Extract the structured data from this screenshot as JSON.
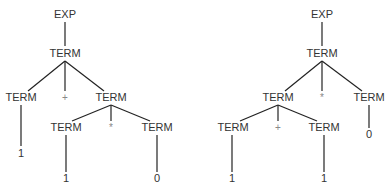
{
  "diagram": {
    "type": "parse-tree-comparison",
    "trees": [
      {
        "id": "left",
        "nodes": [
          {
            "label": "EXP",
            "x": 65,
            "y": 18
          },
          {
            "label": "TERM",
            "x": 65,
            "y": 57
          },
          {
            "label": "TERM",
            "x": 21,
            "y": 101
          },
          {
            "label": "+",
            "x": 65,
            "y": 101,
            "op": true
          },
          {
            "label": "TERM",
            "x": 111,
            "y": 101
          },
          {
            "label": "1",
            "x": 21,
            "y": 157
          },
          {
            "label": "TERM",
            "x": 66,
            "y": 131
          },
          {
            "label": "*",
            "x": 111,
            "y": 131,
            "op": true
          },
          {
            "label": "TERM",
            "x": 157,
            "y": 131
          },
          {
            "label": "1",
            "x": 66,
            "y": 182
          },
          {
            "label": "0",
            "x": 157,
            "y": 182
          }
        ],
        "edges": [
          [
            65,
            22,
            65,
            46
          ],
          [
            65,
            61,
            28,
            91
          ],
          [
            65,
            61,
            65,
            91
          ],
          [
            65,
            61,
            104,
            91
          ],
          [
            21,
            105,
            21,
            146
          ],
          [
            111,
            105,
            72,
            121
          ],
          [
            111,
            105,
            111,
            121
          ],
          [
            111,
            105,
            150,
            121
          ],
          [
            66,
            135,
            66,
            172
          ],
          [
            157,
            135,
            157,
            172
          ]
        ]
      },
      {
        "id": "right",
        "nodes": [
          {
            "label": "EXP",
            "x": 322,
            "y": 18
          },
          {
            "label": "TERM",
            "x": 322,
            "y": 57
          },
          {
            "label": "TERM",
            "x": 278,
            "y": 101
          },
          {
            "label": "*",
            "x": 322,
            "y": 101,
            "op": true
          },
          {
            "label": "TERM",
            "x": 369,
            "y": 101
          },
          {
            "label": "0",
            "x": 369,
            "y": 138
          },
          {
            "label": "TERM",
            "x": 233,
            "y": 131
          },
          {
            "label": "+",
            "x": 278,
            "y": 131,
            "op": true
          },
          {
            "label": "TERM",
            "x": 324,
            "y": 131
          },
          {
            "label": "1",
            "x": 232,
            "y": 182
          },
          {
            "label": "1",
            "x": 324,
            "y": 182
          }
        ],
        "edges": [
          [
            322,
            22,
            322,
            46
          ],
          [
            322,
            61,
            285,
            91
          ],
          [
            322,
            61,
            322,
            91
          ],
          [
            322,
            61,
            362,
            91
          ],
          [
            369,
            105,
            369,
            128
          ],
          [
            278,
            105,
            240,
            121
          ],
          [
            278,
            105,
            278,
            121
          ],
          [
            278,
            105,
            317,
            121
          ],
          [
            232,
            135,
            232,
            172
          ],
          [
            324,
            135,
            324,
            172
          ]
        ]
      }
    ]
  }
}
